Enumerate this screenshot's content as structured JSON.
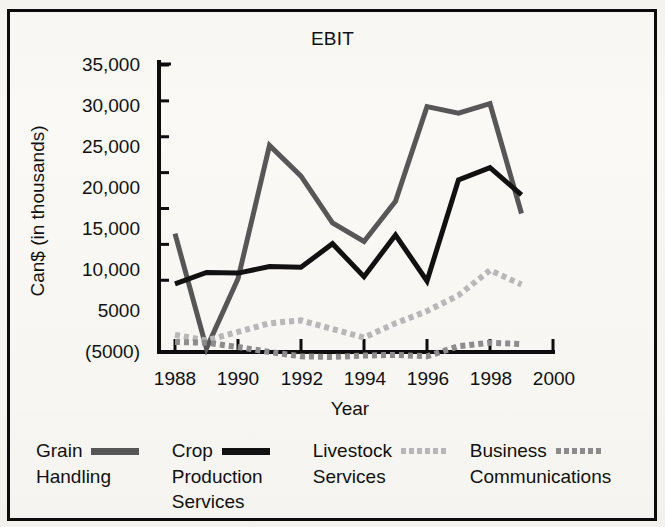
{
  "chart_data": {
    "type": "line",
    "title": "EBIT",
    "xlabel": "Year",
    "ylabel": "Can$ (in thousands)",
    "x": [
      1988,
      1989,
      1990,
      1991,
      1992,
      1993,
      1994,
      1995,
      1996,
      1997,
      1998,
      1999
    ],
    "xticks": [
      "1988",
      "1990",
      "1992",
      "1994",
      "1996",
      "1998",
      "2000"
    ],
    "xtick_values": [
      1988,
      1990,
      1992,
      1994,
      1996,
      1998,
      2000
    ],
    "yticks": [
      "35,000",
      "30,000",
      "25,000",
      "20,000",
      "15,000",
      "10,000",
      "5000",
      "(5000)"
    ],
    "ytick_values": [
      35000,
      30000,
      25000,
      20000,
      15000,
      10000,
      5000,
      -5000
    ],
    "xlim": [
      1987.6,
      2000.2
    ],
    "ylim": [
      -5000,
      35000
    ],
    "grid": false,
    "legend_position": "below",
    "series": [
      {
        "name": "Grain Handling",
        "legend_line1": "Grain",
        "legend_line2": "Handling",
        "color": "#575757",
        "style": "solid",
        "width": 5,
        "values": [
          11500,
          -4500,
          5200,
          23800,
          19500,
          13000,
          10400,
          16000,
          29200,
          28300,
          29600,
          14300
        ]
      },
      {
        "name": "Crop Production Services",
        "legend_line1": "Crop",
        "legend_line2": "Production",
        "legend_line3": "Services",
        "color": "#111111",
        "style": "solid",
        "width": 5,
        "values": [
          4500,
          6100,
          6000,
          6900,
          6800,
          10100,
          5500,
          11300,
          4900,
          19000,
          20700,
          16900
        ]
      },
      {
        "name": "Livestock Services",
        "legend_line1": "Livestock",
        "legend_line2": "Services",
        "color": "#b9b9b9",
        "style": "dotted",
        "width": 6,
        "values": [
          -2600,
          -3400,
          -2200,
          -1000,
          -600,
          -1800,
          -3000,
          -1000,
          700,
          2900,
          6400,
          4400
        ]
      },
      {
        "name": "Business Communications",
        "legend_line1": "Business",
        "legend_line2": "Communications",
        "color": "#8e8e8e",
        "style": "dotted",
        "width": 6,
        "values": [
          -3600,
          -3700,
          -4300,
          -5000,
          -5600,
          -5700,
          -5500,
          -5400,
          -5600,
          -4200,
          -3700,
          -3900
        ]
      }
    ]
  }
}
